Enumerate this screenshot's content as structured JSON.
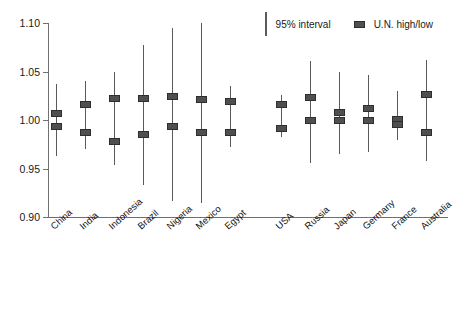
{
  "chart_data": {
    "type": "scatter",
    "title": "",
    "xlabel": "",
    "ylabel": "",
    "ylim": [
      0.9,
      1.1
    ],
    "yticks": [
      0.9,
      0.95,
      1.0,
      1.05,
      1.1
    ],
    "ytick_labels": [
      "0.90",
      "0.95",
      "1.00",
      "1.05",
      "1.10"
    ],
    "grid": false,
    "legend_position": "top-right",
    "legend": [
      {
        "key": "interval",
        "label": "95% interval",
        "glyph": "vertical-line"
      },
      {
        "key": "un_high_low",
        "label": "U.N. high/low",
        "glyph": "square-marker"
      }
    ],
    "categories": [
      "China",
      "India",
      "Indonesia",
      "Brazil",
      "Nigeria",
      "Mexico",
      "Egypt",
      "USA",
      "Russia",
      "Japan",
      "Germany",
      "France",
      "Australia"
    ],
    "group_gap_after": "Egypt",
    "series": [
      {
        "name": "95% interval low",
        "values": [
          0.963,
          0.97,
          0.954,
          0.933,
          0.916,
          0.914,
          0.972,
          0.982,
          0.956,
          0.965,
          0.967,
          0.979,
          0.958
        ]
      },
      {
        "name": "95% interval high",
        "values": [
          1.037,
          1.04,
          1.05,
          1.077,
          1.095,
          1.1,
          1.035,
          1.026,
          1.061,
          1.05,
          1.046,
          1.03,
          1.062
        ]
      },
      {
        "name": "U.N. high",
        "values": [
          1.007,
          1.016,
          1.022,
          1.022,
          1.024,
          1.021,
          1.019,
          1.016,
          1.023,
          1.008,
          1.012,
          1.001,
          1.026
        ]
      },
      {
        "name": "U.N. low",
        "values": [
          0.993,
          0.987,
          0.978,
          0.985,
          0.993,
          0.987,
          0.987,
          0.991,
          0.999,
          0.999,
          1.0,
          0.995,
          0.987
        ]
      }
    ]
  }
}
